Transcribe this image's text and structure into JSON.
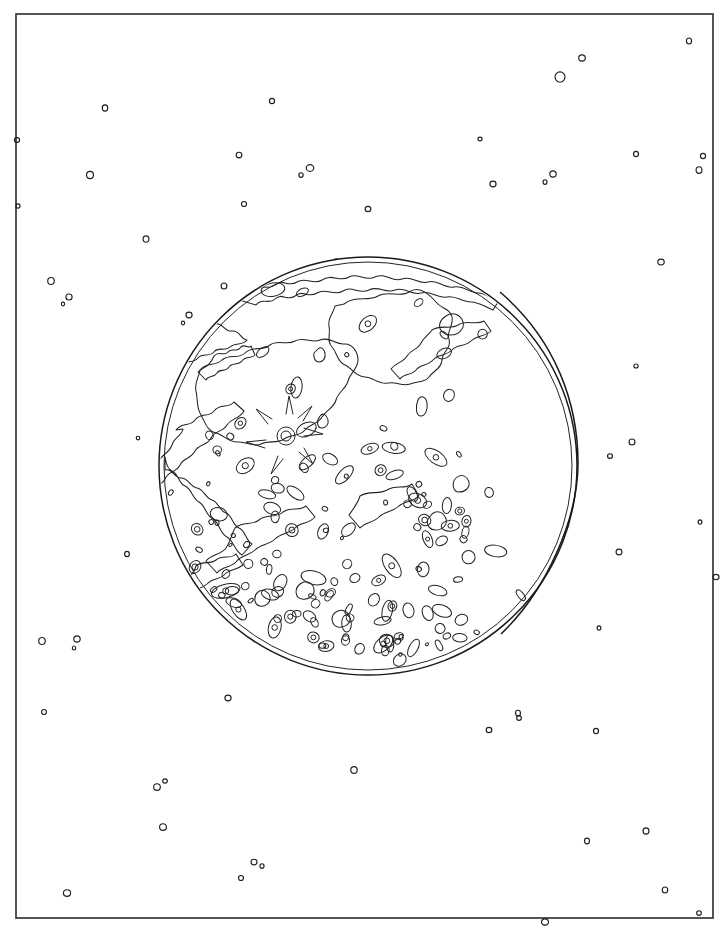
{
  "artwork": {
    "title": "Waning Gibbous Moon Line Drawing",
    "subject": "moon",
    "style": "black-and-white outline / coloring-book line art",
    "background_color": "#ffffff",
    "ink_color": "#1a1a1a",
    "canvas": {
      "width": 728,
      "height": 932
    }
  },
  "frame": {
    "name": "page-border",
    "x": 16,
    "y": 14,
    "width": 697,
    "height": 904,
    "stroke": "#2b2b2b",
    "stroke_width": 1.6
  },
  "moon": {
    "label": "moon-disc",
    "center_x": 368,
    "center_y": 466,
    "radius": 209,
    "phase": "waning gibbous",
    "terminator": {
      "label": "terminator-line",
      "top_x": 500,
      "top_y": 292,
      "bottom_x": 501,
      "bottom_y": 634,
      "bulge_x": 578,
      "bulge_y": 463,
      "description": "shadow boundary arc bowing to the right across the eastern limb"
    },
    "features": {
      "mare_count": 22,
      "crater_count": 146,
      "ray_crater_center_x": 286,
      "ray_crater_center_y": 436,
      "ray_crater_radius": 9
    }
  },
  "starfield": {
    "label": "star-field",
    "count": 62,
    "style": "open circle outlines of varied radius",
    "stars": [
      {
        "x": 689,
        "y": 41,
        "r": 3.0
      },
      {
        "x": 560,
        "y": 77,
        "r": 5.2
      },
      {
        "x": 582,
        "y": 58,
        "r": 3.1
      },
      {
        "x": 105,
        "y": 108,
        "r": 3.1
      },
      {
        "x": 272,
        "y": 101,
        "r": 2.6
      },
      {
        "x": 17,
        "y": 140,
        "r": 2.4
      },
      {
        "x": 636,
        "y": 154,
        "r": 2.7
      },
      {
        "x": 239,
        "y": 155,
        "r": 2.8
      },
      {
        "x": 310,
        "y": 168,
        "r": 3.4
      },
      {
        "x": 301,
        "y": 175,
        "r": 2.3
      },
      {
        "x": 553,
        "y": 174,
        "r": 3.1
      },
      {
        "x": 545,
        "y": 182,
        "r": 2.3
      },
      {
        "x": 90,
        "y": 175,
        "r": 3.6
      },
      {
        "x": 493,
        "y": 184,
        "r": 2.9
      },
      {
        "x": 699,
        "y": 170,
        "r": 3.3
      },
      {
        "x": 703,
        "y": 156,
        "r": 2.6
      },
      {
        "x": 368,
        "y": 209,
        "r": 2.6
      },
      {
        "x": 146,
        "y": 239,
        "r": 3.2
      },
      {
        "x": 244,
        "y": 204,
        "r": 2.5
      },
      {
        "x": 661,
        "y": 262,
        "r": 2.9
      },
      {
        "x": 51,
        "y": 281,
        "r": 3.5
      },
      {
        "x": 69,
        "y": 297,
        "r": 3.0
      },
      {
        "x": 63,
        "y": 304,
        "r": 1.9
      },
      {
        "x": 224,
        "y": 286,
        "r": 3.0
      },
      {
        "x": 189,
        "y": 315,
        "r": 2.9
      },
      {
        "x": 183,
        "y": 323,
        "r": 1.9
      },
      {
        "x": 632,
        "y": 442,
        "r": 3.0
      },
      {
        "x": 610,
        "y": 456,
        "r": 2.3
      },
      {
        "x": 127,
        "y": 554,
        "r": 2.6
      },
      {
        "x": 619,
        "y": 552,
        "r": 2.9
      },
      {
        "x": 716,
        "y": 577,
        "r": 2.7
      },
      {
        "x": 42,
        "y": 641,
        "r": 3.5
      },
      {
        "x": 77,
        "y": 639,
        "r": 3.1
      },
      {
        "x": 74,
        "y": 648,
        "r": 2.0
      },
      {
        "x": 44,
        "y": 712,
        "r": 2.5
      },
      {
        "x": 228,
        "y": 698,
        "r": 2.9
      },
      {
        "x": 518,
        "y": 713,
        "r": 2.8
      },
      {
        "x": 519,
        "y": 718,
        "r": 2.4
      },
      {
        "x": 489,
        "y": 730,
        "r": 2.6
      },
      {
        "x": 596,
        "y": 731,
        "r": 2.7
      },
      {
        "x": 157,
        "y": 787,
        "r": 3.3
      },
      {
        "x": 165,
        "y": 781,
        "r": 2.1
      },
      {
        "x": 354,
        "y": 770,
        "r": 3.4
      },
      {
        "x": 163,
        "y": 827,
        "r": 3.3
      },
      {
        "x": 587,
        "y": 841,
        "r": 2.9
      },
      {
        "x": 646,
        "y": 831,
        "r": 3.1
      },
      {
        "x": 254,
        "y": 862,
        "r": 2.8
      },
      {
        "x": 262,
        "y": 866,
        "r": 2.3
      },
      {
        "x": 241,
        "y": 878,
        "r": 2.5
      },
      {
        "x": 67,
        "y": 893,
        "r": 3.3
      },
      {
        "x": 665,
        "y": 890,
        "r": 3.0
      },
      {
        "x": 699,
        "y": 913,
        "r": 2.3
      },
      {
        "x": 545,
        "y": 922,
        "r": 3.1
      },
      {
        "x": 429,
        "y": 306,
        "r": 2.0
      },
      {
        "x": 463,
        "y": 337,
        "r": 2.4
      },
      {
        "x": 700,
        "y": 522,
        "r": 2.2
      },
      {
        "x": 18,
        "y": 206,
        "r": 2.1
      },
      {
        "x": 636,
        "y": 366,
        "r": 2.0
      },
      {
        "x": 599,
        "y": 628,
        "r": 2.1
      },
      {
        "x": 138,
        "y": 438,
        "r": 1.8
      },
      {
        "x": 480,
        "y": 139,
        "r": 1.9
      },
      {
        "x": 336,
        "y": 261,
        "r": 2.2
      }
    ]
  },
  "chart_data": {
    "type": "scatter",
    "xlabel": "",
    "ylabel": "",
    "xlim": [
      0,
      728
    ],
    "ylim": [
      0,
      932
    ],
    "grid": false,
    "legend": "none",
    "series": [
      {
        "name": "stars",
        "marker": "open circle",
        "count": 62
      },
      {
        "name": "moon-disc",
        "marker": "circle outline",
        "count": 1
      },
      {
        "name": "lunar-maria-contours",
        "marker": "closed polyline",
        "count": 22
      },
      {
        "name": "craters",
        "marker": "small ellipse outline",
        "count": 146
      }
    ]
  }
}
